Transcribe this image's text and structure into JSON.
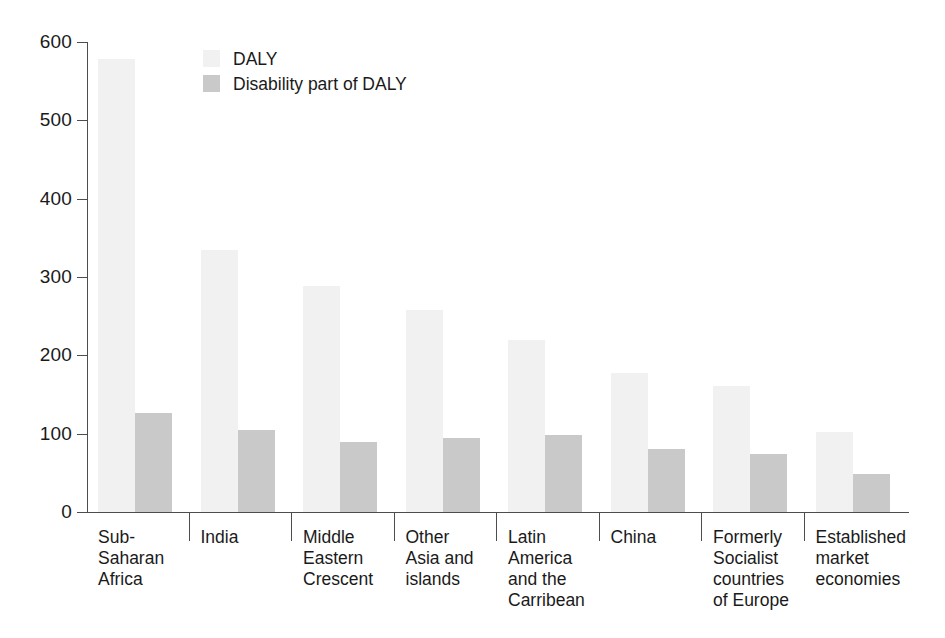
{
  "chart_data": {
    "type": "bar",
    "title": "",
    "subtitle": "",
    "xlabel": "",
    "ylabel": "",
    "ylim": [
      0,
      600
    ],
    "yticks": [
      0,
      100,
      200,
      300,
      400,
      500,
      600
    ],
    "ytick_labels": [
      "0",
      "100",
      "200",
      "300",
      "400",
      "500",
      "600"
    ],
    "grid": false,
    "legend_position": "top-left-inside",
    "categories": [
      "Sub-\nSaharan\nAfrica",
      "India",
      "Middle\nEastern\nCrescent",
      "Other\nAsia and\nislands",
      "Latin\nAmerica\nand the\nCarribean",
      "China",
      "Formerly\nSocialist\ncountries\nof Europe",
      "Established\nmarket\neconomies"
    ],
    "series": [
      {
        "name": "DALY",
        "color": "#f1f1f1",
        "values": [
          578,
          335,
          288,
          258,
          219,
          177,
          161,
          102
        ]
      },
      {
        "name": "Disability part of DALY",
        "color": "#c9c9c9",
        "values": [
          126,
          105,
          89,
          95,
          98,
          80,
          74,
          49
        ]
      }
    ]
  },
  "legend": {
    "items": [
      {
        "label": "DALY",
        "swatch": "daly"
      },
      {
        "label": "Disability part of DALY",
        "swatch": "disability"
      }
    ]
  },
  "colors": {
    "daly": "#f1f1f1",
    "disability": "#c9c9c9",
    "axis": "#4d4d4d",
    "text": "#1a1a1a",
    "background": "#ffffff"
  }
}
